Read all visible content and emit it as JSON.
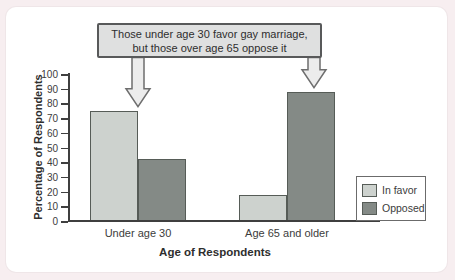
{
  "chart_data": {
    "type": "bar",
    "categories": [
      "Under age 30",
      "Age 65 and older"
    ],
    "series": [
      {
        "name": "In favor",
        "color": "#cdd2ce",
        "values": [
          75,
          18
        ]
      },
      {
        "name": "Opposed",
        "color": "#848a86",
        "values": [
          42,
          88
        ]
      }
    ],
    "xlabel": "Age of Respondents",
    "ylabel": "Percentage of Respondents",
    "ylim": [
      0,
      100
    ],
    "ytick_step": 10,
    "grid": false,
    "legend_position": "right-inside",
    "annotation_lines": [
      "Those under age 30 favor gay marriage,",
      "but those over age 65 oppose it"
    ],
    "annotation_arrow_targets": [
      {
        "category_index": 0,
        "series_index": 0
      },
      {
        "category_index": 1,
        "series_index": 1
      }
    ]
  },
  "colors": {
    "page_background": "#f7eef0",
    "panel_background": "#ffffff",
    "in_favor": "#cdd2ce",
    "opposed": "#848a86",
    "annotation_fill": "#dfe0e0",
    "annotation_border": "#58595a",
    "arrow_fill": "#ececec",
    "arrow_stroke": "#6e6e6e",
    "axis": "#3f3f3f"
  }
}
